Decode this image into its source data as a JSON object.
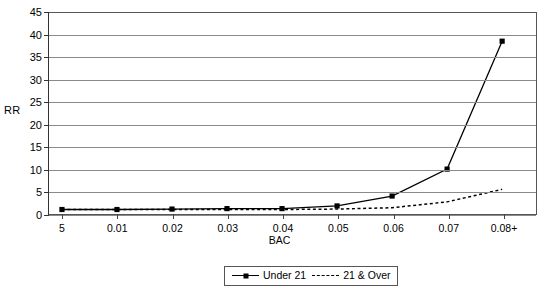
{
  "chart_data": {
    "type": "line",
    "title": "",
    "xlabel": "BAC",
    "ylabel": "RR",
    "categories": [
      "5",
      "0.01",
      "0.02",
      "0.03",
      "0.04",
      "0.05",
      "0.06",
      "0.07",
      "0.08+"
    ],
    "ylim": [
      0,
      45
    ],
    "yticks": [
      0,
      5,
      10,
      15,
      20,
      25,
      30,
      35,
      40,
      45
    ],
    "ytick_labels": [
      "0",
      "5",
      "10",
      "15",
      "20",
      "25",
      "30",
      "35",
      "40",
      "45"
    ],
    "grid": true,
    "legend_position": "bottom-center",
    "series": [
      {
        "name": "Under 21",
        "style": "solid",
        "marker": "square",
        "color": "#000000",
        "values": [
          1.0,
          1.0,
          1.1,
          1.2,
          1.2,
          1.8,
          4.0,
          10.0,
          38.5
        ]
      },
      {
        "name": "21 & Over",
        "style": "dashed",
        "marker": "none",
        "color": "#000000",
        "values": [
          1.0,
          1.0,
          1.0,
          1.0,
          1.0,
          1.1,
          1.4,
          2.7,
          5.5
        ]
      }
    ]
  },
  "legend": {
    "entries": [
      {
        "label": "Under 21",
        "swatch": "solid-line-square-marker"
      },
      {
        "label": "21 & Over",
        "swatch": "dashed-line"
      }
    ]
  },
  "axes": {
    "y_title": "RR",
    "x_title": "BAC"
  }
}
